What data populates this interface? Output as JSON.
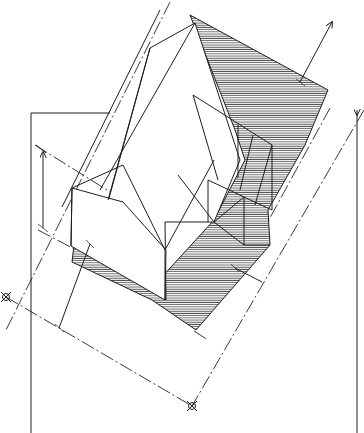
{
  "figure": {
    "type": "architectural axonometric drawing",
    "caption_partial": "",
    "colors": {
      "ink": "#1e1e1e",
      "background": "#ffffff",
      "hatch": "#555555"
    },
    "elements": {
      "house": "gable-roof house with side annex",
      "shadow": "hatched cast shadow",
      "dimension_lines": 5,
      "axis_markers": 3,
      "boundary_lines": 2
    }
  }
}
